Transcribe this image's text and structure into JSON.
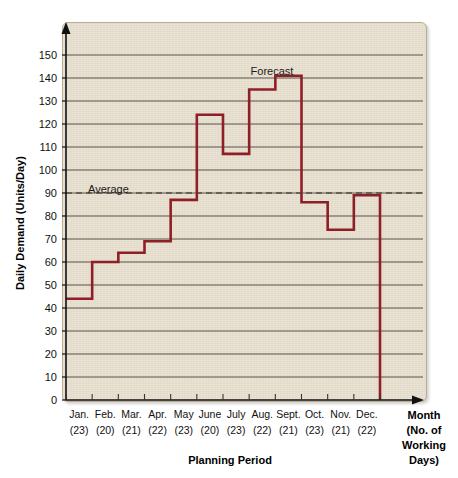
{
  "chart_data": {
    "type": "line",
    "subtype": "step",
    "title": "",
    "xlabel": "Planning Period",
    "ylabel": "Daily Demand (Units/Day)",
    "right_axis_label": "Month (No. of Working Days)",
    "categories": [
      "Jan.",
      "Feb.",
      "Mar.",
      "Apr.",
      "May",
      "June",
      "July",
      "Aug.",
      "Sept.",
      "Oct.",
      "Nov.",
      "Dec."
    ],
    "working_days": [
      "(23)",
      "(20)",
      "(21)",
      "(22)",
      "(23)",
      "(20)",
      "(23)",
      "(22)",
      "(21)",
      "(23)",
      "(21)",
      "(22)"
    ],
    "series": [
      {
        "name": "Forecast",
        "values": [
          44,
          60,
          64,
          69,
          87,
          124,
          107,
          135,
          141,
          86,
          74,
          89
        ]
      }
    ],
    "average": 90,
    "ylim": [
      0,
      155
    ],
    "yticks": [
      0,
      10,
      20,
      30,
      40,
      50,
      60,
      70,
      80,
      90,
      100,
      110,
      120,
      130,
      140,
      150
    ],
    "ytick_labels": [
      "0",
      "10",
      "20",
      "30",
      "40",
      "50",
      "60",
      "70",
      "80",
      "90",
      "100",
      "110",
      "120",
      "130",
      "140",
      "150"
    ],
    "grid": true,
    "legend": "none",
    "annotations": [
      {
        "text": "Average",
        "x_category": "Mar.",
        "y": 95
      },
      {
        "text": "Forecast",
        "x_category": "Sept.",
        "y": 147
      }
    ],
    "colors": {
      "line": "#8e1f26",
      "plot_background": "#e9e1d0",
      "gridline": "#4a4438",
      "axis": "#111111",
      "average_line": "#555047"
    }
  },
  "figure": {
    "y_axis_title": "Daily Demand (Units/Day)",
    "x_axis_title": "Planning Period",
    "right_label_lines": [
      "Month",
      "(No. of",
      "Working",
      "Days)"
    ],
    "average_label": "Average",
    "forecast_label": "Forecast"
  }
}
